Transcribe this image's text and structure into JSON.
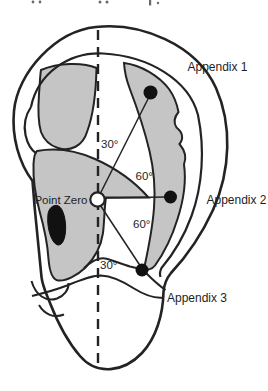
{
  "diagram": {
    "kind": "ear-acupuncture-map",
    "center_point": {
      "label": "Point Zero"
    },
    "points": [
      {
        "label": "Appendix 1"
      },
      {
        "label": "Appendix 2"
      },
      {
        "label": "Appendix 3"
      }
    ],
    "angle_labels": {
      "upper_inner": "30°",
      "upper_outer": "60°",
      "lower_outer": "60°",
      "lower_inner": "30°"
    },
    "colors": {
      "shaded_zone": "#c5c5c5",
      "outline": "#232323",
      "marker": "#111111",
      "background": "#ffffff"
    }
  }
}
